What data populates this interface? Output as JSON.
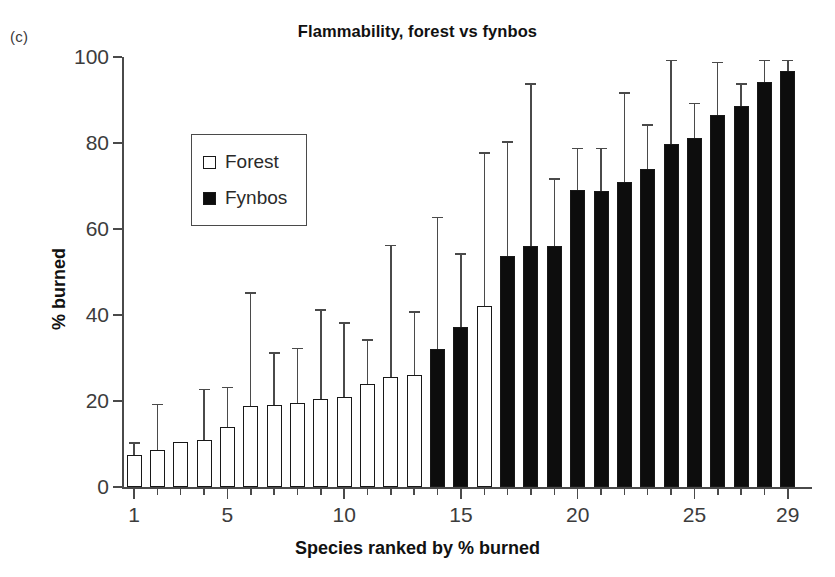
{
  "panel_label": "(c)",
  "chart_data": {
    "type": "bar",
    "title": "Flammability, forest vs fynbos",
    "xlabel": "Species ranked by % burned",
    "ylabel": "% burned",
    "ylim": [
      0,
      100
    ],
    "xlim": [
      0.3,
      29.7
    ],
    "grid": false,
    "legend_position": "upper-left-inside",
    "y_ticks": [
      0,
      20,
      40,
      60,
      80,
      100
    ],
    "y_tick_labels": [
      "0",
      "20",
      "40",
      "60",
      "80",
      "100"
    ],
    "x_ticks": [
      1,
      5,
      10,
      15,
      20,
      25,
      29
    ],
    "x_tick_labels": [
      "1",
      "5",
      "10",
      "15",
      "20",
      "25",
      "29"
    ],
    "x_minor_ticks_all": true,
    "categories": [
      1,
      2,
      3,
      4,
      5,
      6,
      7,
      8,
      9,
      10,
      11,
      12,
      13,
      14,
      15,
      16,
      17,
      18,
      19,
      20,
      21,
      22,
      23,
      24,
      25,
      26,
      27,
      28,
      29
    ],
    "legend": [
      {
        "name": "Forest",
        "fill": "#ffffff",
        "edge": "#181818"
      },
      {
        "name": "Fynbos",
        "fill": "#0d0d0d",
        "edge": "#181818"
      }
    ],
    "error_bar_type": "upper-only",
    "bars": [
      {
        "rank": 1,
        "group": "Forest",
        "value": 7.5,
        "error_top": 10.0
      },
      {
        "rank": 2,
        "group": "Forest",
        "value": 8.5,
        "error_top": 19.0
      },
      {
        "rank": 3,
        "group": "Forest",
        "value": 10.5,
        "error_top": 10.5
      },
      {
        "rank": 4,
        "group": "Forest",
        "value": 11.0,
        "error_top": 22.5
      },
      {
        "rank": 5,
        "group": "Forest",
        "value": 14.0,
        "error_top": 23.0
      },
      {
        "rank": 6,
        "group": "Forest",
        "value": 18.8,
        "error_top": 45.0
      },
      {
        "rank": 7,
        "group": "Forest",
        "value": 19.0,
        "error_top": 31.0
      },
      {
        "rank": 8,
        "group": "Forest",
        "value": 19.5,
        "error_top": 32.0
      },
      {
        "rank": 9,
        "group": "Forest",
        "value": 20.5,
        "error_top": 41.0
      },
      {
        "rank": 10,
        "group": "Forest",
        "value": 21.0,
        "error_top": 38.0
      },
      {
        "rank": 11,
        "group": "Forest",
        "value": 24.0,
        "error_top": 34.0
      },
      {
        "rank": 12,
        "group": "Forest",
        "value": 25.7,
        "error_top": 56.0
      },
      {
        "rank": 13,
        "group": "Forest",
        "value": 26.0,
        "error_top": 40.5
      },
      {
        "rank": 14,
        "group": "Fynbos",
        "value": 32.2,
        "error_top": 62.5
      },
      {
        "rank": 15,
        "group": "Fynbos",
        "value": 37.2,
        "error_top": 54.0
      },
      {
        "rank": 16,
        "group": "Forest",
        "value": 42.2,
        "error_top": 77.5
      },
      {
        "rank": 17,
        "group": "Fynbos",
        "value": 53.8,
        "error_top": 80.0
      },
      {
        "rank": 18,
        "group": "Fynbos",
        "value": 56.0,
        "error_top": 93.5
      },
      {
        "rank": 19,
        "group": "Fynbos",
        "value": 56.0,
        "error_top": 71.5
      },
      {
        "rank": 20,
        "group": "Fynbos",
        "value": 69.0,
        "error_top": 78.5
      },
      {
        "rank": 21,
        "group": "Fynbos",
        "value": 68.8,
        "error_top": 78.5
      },
      {
        "rank": 22,
        "group": "Fynbos",
        "value": 71.0,
        "error_top": 91.5
      },
      {
        "rank": 23,
        "group": "Fynbos",
        "value": 74.0,
        "error_top": 84.0
      },
      {
        "rank": 24,
        "group": "Fynbos",
        "value": 79.8,
        "error_top": 99.0
      },
      {
        "rank": 25,
        "group": "Fynbos",
        "value": 81.2,
        "error_top": 89.0
      },
      {
        "rank": 26,
        "group": "Fynbos",
        "value": 86.5,
        "error_top": 98.5
      },
      {
        "rank": 27,
        "group": "Fynbos",
        "value": 88.5,
        "error_top": 93.5
      },
      {
        "rank": 28,
        "group": "Fynbos",
        "value": 94.2,
        "error_top": 99.0
      },
      {
        "rank": 29,
        "group": "Fynbos",
        "value": 96.8,
        "error_top": 99.0
      }
    ]
  }
}
